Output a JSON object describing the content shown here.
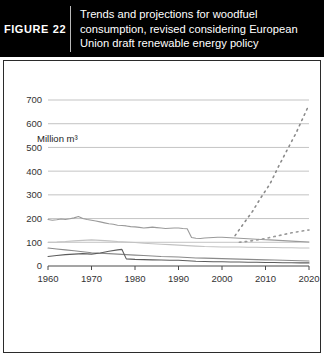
{
  "header": {
    "figure_tag": "FIGURE  22",
    "title_lines": [
      "Trends and projections for woodfuel",
      "consumption, revised considering European",
      "Union draft renewable energy policy"
    ],
    "background_color": "#000000",
    "text_color": "#ffffff"
  },
  "legend": {
    "rows": [
      [
        {
          "label": "Total Europe",
          "color": "#9a9a9a",
          "name": "legend-total-europe"
        },
        {
          "label": "Western Europe",
          "color": "#c2c2c2",
          "name": "legend-western-europe"
        }
      ],
      [
        {
          "label": "CIS countries",
          "color": "#5c5c5c",
          "name": "legend-cis-countries"
        },
        {
          "label": "Eastern Europe",
          "color": "#8a8a8a",
          "name": "legend-eastern-europe"
        }
      ]
    ]
  },
  "chart_data": {
    "type": "line",
    "title": "Trends and projections for woodfuel consumption, revised considering European Union draft renewable energy policy",
    "xlabel": "",
    "ylabel": "Million m³",
    "y_unit_label": "Million m³",
    "xlim": [
      1960,
      2020
    ],
    "ylim": [
      0,
      700
    ],
    "x_ticks": [
      1960,
      1970,
      1980,
      1990,
      2000,
      2010,
      2020
    ],
    "y_ticks": [
      0,
      100,
      200,
      300,
      400,
      500,
      600,
      700
    ],
    "grid": "horizontal",
    "legend_position": "bottom",
    "series": [
      {
        "name": "Total Europe",
        "color": "#9a9a9a",
        "style": "solid",
        "x": [
          1960,
          1961,
          1962,
          1963,
          1964,
          1965,
          1966,
          1967,
          1968,
          1969,
          1970,
          1971,
          1972,
          1973,
          1974,
          1975,
          1976,
          1977,
          1978,
          1979,
          1980,
          1981,
          1982,
          1983,
          1984,
          1985,
          1986,
          1987,
          1988,
          1989,
          1990,
          1991,
          1992,
          1993,
          1994,
          1995,
          1996,
          1997,
          1998,
          1999,
          2000,
          2001,
          2002,
          2003,
          2004,
          2005,
          2006,
          2007,
          2008,
          2009,
          2010,
          2011,
          2012,
          2013,
          2014,
          2015,
          2016,
          2017,
          2018,
          2019,
          2020
        ],
        "values": [
          196,
          193,
          195,
          198,
          196,
          199,
          203,
          209,
          200,
          196,
          193,
          190,
          186,
          182,
          178,
          176,
          172,
          171,
          169,
          166,
          165,
          163,
          160,
          162,
          164,
          162,
          160,
          158,
          159,
          160,
          160,
          158,
          157,
          120,
          117,
          116,
          118,
          119,
          120,
          121,
          121,
          120,
          119,
          118,
          117,
          116,
          115,
          114,
          113,
          112,
          111,
          110,
          109,
          108,
          107,
          106,
          105,
          104,
          103,
          102,
          101
        ]
      },
      {
        "name": "Western Europe",
        "color": "#c2c2c2",
        "style": "solid",
        "x": [
          1960,
          1962,
          1964,
          1966,
          1968,
          1970,
          1972,
          1974,
          1976,
          1978,
          1980,
          1982,
          1984,
          1986,
          1988,
          1990,
          1992,
          1994,
          1996,
          1998,
          2000,
          2002,
          2004,
          2006,
          2008,
          2010,
          2012,
          2014,
          2016,
          2018,
          2020
        ],
        "values": [
          100,
          101,
          103,
          106,
          108,
          110,
          108,
          106,
          103,
          101,
          99,
          96,
          94,
          92,
          90,
          88,
          86,
          84,
          82,
          81,
          80,
          80,
          80,
          79,
          79,
          78,
          78,
          77,
          77,
          76,
          76
        ]
      },
      {
        "name": "Eastern Europe",
        "color": "#8a8a8a",
        "style": "solid",
        "x": [
          1960,
          1962,
          1964,
          1966,
          1968,
          1970,
          1972,
          1974,
          1976,
          1978,
          1980,
          1982,
          1984,
          1986,
          1988,
          1990,
          1992,
          1994,
          1996,
          1998,
          2000,
          2002,
          2004,
          2006,
          2008,
          2010,
          2012,
          2014,
          2016,
          2018,
          2020
        ],
        "values": [
          76,
          72,
          68,
          64,
          60,
          56,
          54,
          52,
          50,
          48,
          46,
          44,
          42,
          40,
          39,
          38,
          36,
          34,
          33,
          32,
          31,
          30,
          29,
          28,
          27,
          26,
          25,
          24,
          23,
          22,
          21
        ]
      },
      {
        "name": "CIS countries",
        "color": "#5c5c5c",
        "style": "solid",
        "x": [
          1960,
          1962,
          1964,
          1966,
          1968,
          1970,
          1972,
          1974,
          1976,
          1977,
          1978,
          1980,
          1982,
          1984,
          1986,
          1988,
          1990,
          1991,
          1992,
          1994,
          1996,
          1998,
          2000,
          2002,
          2004,
          2006,
          2008,
          2010,
          2012,
          2014,
          2016,
          2018,
          2020
        ],
        "values": [
          40,
          44,
          48,
          50,
          52,
          50,
          55,
          62,
          68,
          70,
          30,
          28,
          27,
          26,
          25,
          24,
          24,
          23,
          22,
          20,
          19,
          18,
          18,
          17,
          17,
          16,
          16,
          15,
          15,
          14,
          14,
          13,
          13
        ]
      },
      {
        "name": "Total Europe projection",
        "color": "#8a8a8a",
        "style": "dotted",
        "x": [
          2003,
          2005,
          2007,
          2009,
          2011,
          2013,
          2015,
          2017,
          2019,
          2020
        ],
        "values": [
          128,
          180,
          230,
          290,
          345,
          420,
          490,
          560,
          640,
          680
        ]
      },
      {
        "name": "Western Europe projection",
        "color": "#9a9a9a",
        "style": "dotted",
        "x": [
          2004,
          2006,
          2008,
          2010,
          2012,
          2014,
          2016,
          2018,
          2020
        ],
        "values": [
          100,
          104,
          110,
          116,
          124,
          132,
          140,
          146,
          152
        ]
      }
    ]
  }
}
